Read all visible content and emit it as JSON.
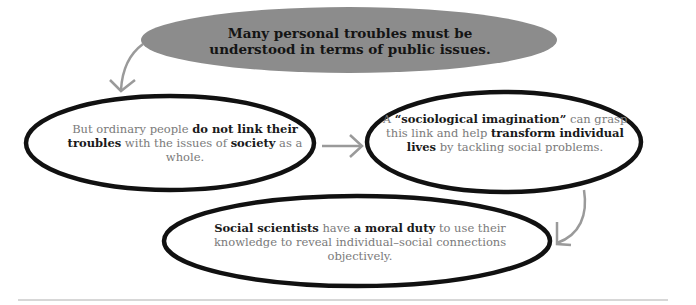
{
  "diagram": {
    "title_node": {
      "text": "Many personal troubles must be understood in terms of public issues.",
      "line1": "Many personal troubles must be",
      "line2": "understood in terms of public issues."
    },
    "nodes": [
      {
        "id": "ordinary-people",
        "segments": [
          {
            "text": "But ordinary people ",
            "bold": false
          },
          {
            "text": "do not link their troubles",
            "bold": true
          },
          {
            "text": " with the issues of ",
            "bold": false
          },
          {
            "text": "society",
            "bold": true
          },
          {
            "text": " as a whole.",
            "bold": false
          }
        ]
      },
      {
        "id": "sociological-imagination",
        "segments": [
          {
            "text": "A ",
            "bold": false
          },
          {
            "text": "“sociological imagination”",
            "bold": true
          },
          {
            "text": " can grasp this link and help ",
            "bold": false
          },
          {
            "text": "transform individual lives",
            "bold": true
          },
          {
            "text": " by tackling social problems.",
            "bold": false
          }
        ]
      },
      {
        "id": "moral-duty",
        "segments": [
          {
            "text": "Social scientists",
            "bold": true
          },
          {
            "text": " have ",
            "bold": false
          },
          {
            "text": "a moral duty",
            "bold": true
          },
          {
            "text": " to use their knowledge to reveal individual–social connections objectively.",
            "bold": false
          }
        ]
      }
    ],
    "edges": [
      {
        "from": "title_node",
        "to": "ordinary-people"
      },
      {
        "from": "ordinary-people",
        "to": "sociological-imagination"
      },
      {
        "from": "sociological-imagination",
        "to": "moral-duty"
      }
    ],
    "colors": {
      "title_fill": "#8c8c8c",
      "outline": "#111111",
      "arrow": "#9a9a9a",
      "body_text": "#7a7a7a",
      "bold_text": "#1a1a1a",
      "divider": "#b0b0b0"
    }
  }
}
